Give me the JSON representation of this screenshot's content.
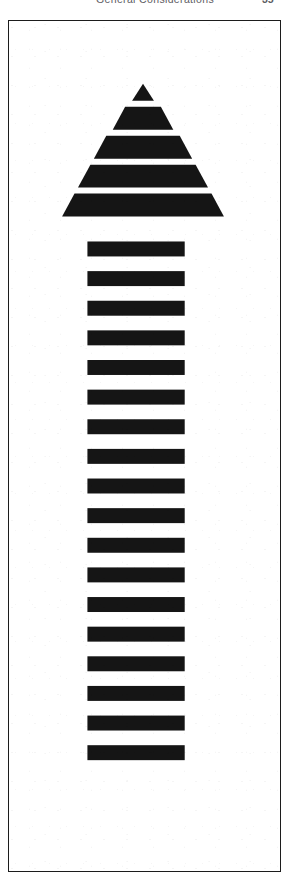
{
  "page": {
    "width": 298,
    "height": 891,
    "background_color": "#ffffff"
  },
  "running_head": {
    "title": "General Considerations",
    "page_number": "35",
    "text_color": "#5d5d63"
  },
  "figure": {
    "name": "striped-upward-arrow",
    "frame": {
      "x": 8,
      "y": 20,
      "width": 273,
      "height": 852,
      "border_color": "#1c1c1c",
      "border_width": 1.5,
      "fill_color": "#ffffff"
    },
    "ink_color": "#151515",
    "arrowhead": {
      "apex_x": 143,
      "apex_y": 83,
      "base_y": 252,
      "base_left_x": 52,
      "base_right_x": 234,
      "band_count": 5,
      "bands": [
        {
          "index": 1,
          "top": 83,
          "bottom": 100,
          "top_width": 0,
          "bottom_width": 22,
          "shape": "triangle"
        },
        {
          "index": 2,
          "top": 106,
          "bottom": 129,
          "top_width": 36,
          "bottom_width": 61,
          "shape": "trapezoid"
        },
        {
          "index": 3,
          "top": 135,
          "bottom": 158,
          "top_width": 74,
          "bottom_width": 99,
          "shape": "trapezoid"
        },
        {
          "index": 4,
          "top": 164,
          "bottom": 187,
          "top_width": 106,
          "bottom_width": 131,
          "shape": "trapezoid"
        },
        {
          "index": 5,
          "top": 193,
          "bottom": 216,
          "top_width": 138,
          "bottom_width": 163,
          "shape": "trapezoid"
        }
      ]
    },
    "shaft": {
      "bar_count": 18,
      "bar_left_x": 87,
      "bar_right_x": 185,
      "bar_width": 98,
      "bar_height": 15,
      "first_bar_top": 241,
      "pitch": 29.7,
      "bars_top": [
        241,
        270.7,
        300.4,
        330.1,
        359.8,
        389.5,
        419.2,
        448.9,
        478.6,
        508.3,
        538.0,
        567.7,
        597.4,
        627.1,
        656.8,
        686.5,
        716.2,
        745.9
      ]
    }
  }
}
